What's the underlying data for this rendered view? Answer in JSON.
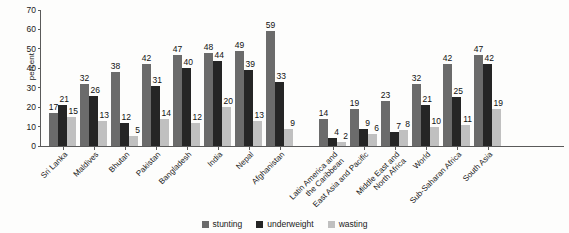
{
  "chart_data": {
    "type": "bar",
    "title": "",
    "xlabel": "",
    "ylabel": "percent",
    "ylim": [
      0,
      70
    ],
    "yticks": [
      0,
      10,
      20,
      30,
      40,
      50,
      60,
      70
    ],
    "grid": false,
    "legend_position": "bottom-center",
    "categories": [
      "Sri Lanka",
      "Maldives",
      "Bhutan",
      "Pakistan",
      "Bangladesh",
      "India",
      "Nepal",
      "Afghanistan",
      "Latin America and the Caribbean",
      "East Asia and Pacific",
      "Middle East and North Africa",
      "World",
      "Sub-Saharan Africa",
      "South Asia"
    ],
    "series": [
      {
        "name": "stunting",
        "color": "#6b6b6b",
        "values": [
          17,
          32,
          38,
          42,
          47,
          48,
          49,
          59,
          14,
          19,
          23,
          32,
          42,
          47
        ]
      },
      {
        "name": "underweight",
        "color": "#252525",
        "values": [
          21,
          26,
          12,
          31,
          40,
          44,
          39,
          33,
          4,
          9,
          7,
          21,
          25,
          42
        ]
      },
      {
        "name": "wasting",
        "color": "#c0c0c0",
        "values": [
          15,
          13,
          5,
          14,
          12,
          20,
          13,
          9,
          2,
          6,
          8,
          10,
          11,
          19
        ]
      }
    ]
  },
  "axis": {
    "y_label": "percent",
    "y_ticks": [
      "0",
      "10",
      "20",
      "30",
      "40",
      "50",
      "60",
      "70"
    ]
  },
  "x_labels": [
    {
      "lines": "Sri Lanka"
    },
    {
      "lines": "Maldives"
    },
    {
      "lines": "Bhutan"
    },
    {
      "lines": "Pakistan"
    },
    {
      "lines": "Bangladesh"
    },
    {
      "lines": "India"
    },
    {
      "lines": "Nepal"
    },
    {
      "lines": "Afghanistan"
    },
    {
      "lines": "Latin America and\nthe Caribbean"
    },
    {
      "lines": "East Asia and Pacific"
    },
    {
      "lines": "Middle East and\nNorth Africa"
    },
    {
      "lines": "World"
    },
    {
      "lines": "Sub-Saharan Africa"
    },
    {
      "lines": "South Asia"
    }
  ],
  "legend": {
    "items": [
      {
        "label": "stunting",
        "key": "stunting"
      },
      {
        "label": "underweight",
        "key": "underweight"
      },
      {
        "label": "wasting",
        "key": "wasting"
      }
    ]
  }
}
